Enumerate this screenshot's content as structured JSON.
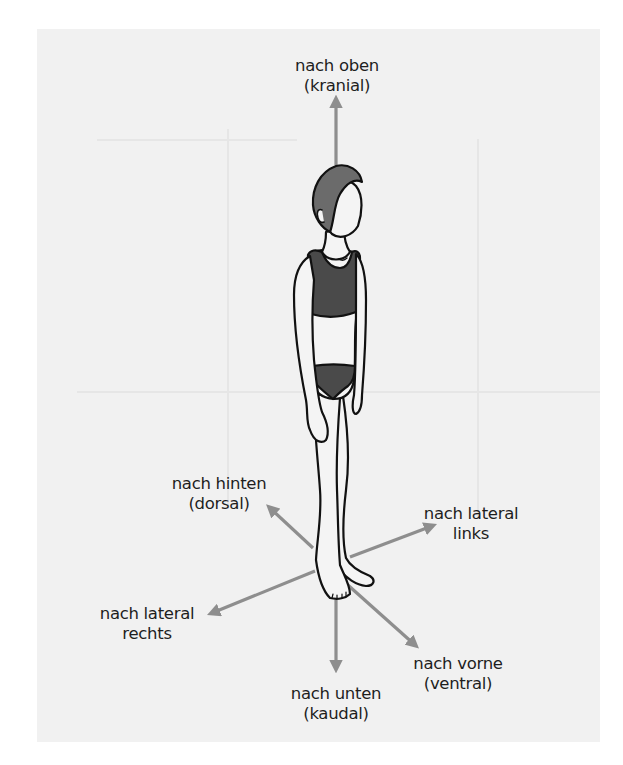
{
  "diagram": {
    "type": "anatomical-directions",
    "colors": {
      "background": "#ffffff",
      "panel": "#f1f1f1",
      "arrow": "#8e8e8e",
      "outline": "#111111",
      "hair": "#6b6b6b",
      "clothing": "#4a4a4a",
      "skin": "#f4f4f4",
      "text": "#1e1e1e"
    },
    "labels": {
      "up": {
        "line1": "nach oben",
        "line2": "(kranial)"
      },
      "down": {
        "line1": "nach unten",
        "line2": "(kaudal)"
      },
      "back": {
        "line1": "nach hinten",
        "line2": "(dorsal)"
      },
      "front": {
        "line1": "nach vorne",
        "line2": "(ventral)"
      },
      "left": {
        "line1": "nach lateral",
        "line2": "links"
      },
      "right": {
        "line1": "nach lateral",
        "line2": "rechts"
      }
    },
    "figure": "standing-child-in-underwear",
    "icons": {
      "arrow_up": "arrow-up-icon",
      "arrow_down": "arrow-down-icon",
      "arrow_back": "arrow-up-left-icon",
      "arrow_front": "arrow-down-right-icon",
      "arrow_left_lateral": "arrow-up-right-icon",
      "arrow_right_lateral": "arrow-down-left-icon"
    }
  }
}
